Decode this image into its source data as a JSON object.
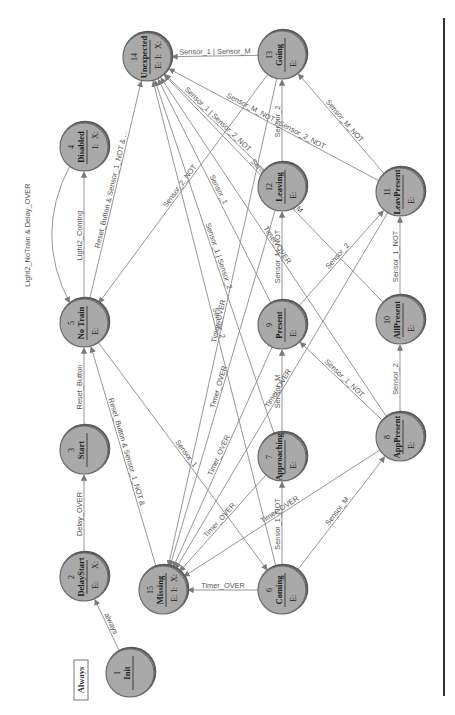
{
  "diagram": {
    "type": "state-machine",
    "orientation": "rotated-90-ccw",
    "colors": {
      "node_fill": "#a9a9a9",
      "node_stroke": "#6d6d6d",
      "edge": "#8a8a8a",
      "label": "#555555",
      "rule": "#333333"
    },
    "legend": {
      "label": "Always"
    },
    "nodes": [
      {
        "id": "1",
        "name": "Init",
        "x": 130,
        "y": 673,
        "marks": []
      },
      {
        "id": "2",
        "name": "DelayStart",
        "x": 84,
        "y": 577,
        "marks": [
          "E:",
          "X:"
        ]
      },
      {
        "id": "3",
        "name": "Start",
        "x": 84,
        "y": 450,
        "marks": []
      },
      {
        "id": "4",
        "name": "Disabled",
        "x": 84,
        "y": 147,
        "marks": [
          "I:",
          "X:"
        ]
      },
      {
        "id": "5",
        "name": "No Train",
        "x": 84,
        "y": 323,
        "marks": [
          "E:"
        ]
      },
      {
        "id": "6",
        "name": "Coming",
        "x": 282,
        "y": 590,
        "marks": [
          "E:"
        ]
      },
      {
        "id": "7",
        "name": "Approaching",
        "x": 282,
        "y": 457,
        "marks": [
          "E:"
        ]
      },
      {
        "id": "8",
        "name": "AppPresent",
        "x": 400,
        "y": 437,
        "marks": [
          "E:"
        ]
      },
      {
        "id": "9",
        "name": "Present",
        "x": 282,
        "y": 325,
        "marks": [
          "E:"
        ]
      },
      {
        "id": "10",
        "name": "AllPresent",
        "x": 400,
        "y": 320,
        "marks": [
          "E:"
        ]
      },
      {
        "id": "11",
        "name": "LeavPresent",
        "x": 400,
        "y": 192,
        "marks": [
          "E:"
        ]
      },
      {
        "id": "12",
        "name": "Leaving",
        "x": 282,
        "y": 187,
        "marks": [
          "E:"
        ]
      },
      {
        "id": "13",
        "name": "Going",
        "x": 282,
        "y": 55,
        "marks": [
          "E:"
        ]
      },
      {
        "id": "14",
        "name": "Unexpected",
        "x": 147,
        "y": 57,
        "marks": [
          "E:",
          "I:",
          "X:"
        ]
      },
      {
        "id": "15",
        "name": "Missing",
        "x": 163,
        "y": 590,
        "marks": [
          "E:",
          "I:",
          "X:"
        ]
      }
    ],
    "edges": [
      {
        "from": "1",
        "to": "2",
        "label": "always"
      },
      {
        "from": "2",
        "to": "3",
        "label": "Delay_OVER"
      },
      {
        "from": "3",
        "to": "5",
        "label": "Reset_Button"
      },
      {
        "from": "4",
        "to": "5",
        "label": "Light2_NoTrain & Delay_OVER",
        "curve": "left"
      },
      {
        "from": "5",
        "to": "4",
        "label": "Light2_Coming"
      },
      {
        "from": "5",
        "to": "14",
        "label": "Reset_Button & Sensor_1_NOT & ..."
      },
      {
        "from": "15",
        "to": "5",
        "label": "Reset_Button & Sensor_1_NOT & ..."
      },
      {
        "from": "5",
        "to": "6",
        "label": "Sensor_1"
      },
      {
        "from": "6",
        "to": "15",
        "label": "Timer_OVER"
      },
      {
        "from": "6",
        "to": "7",
        "label": "Sensor_1_NOT"
      },
      {
        "from": "6",
        "to": "8",
        "label": "Sensor_M"
      },
      {
        "from": "7",
        "to": "15",
        "label": "Timer_OVER"
      },
      {
        "from": "7",
        "to": "9",
        "label": "Sensor_M"
      },
      {
        "from": "8",
        "to": "15",
        "label": "Timer_OVER"
      },
      {
        "from": "8",
        "to": "9",
        "label": "Sensor_1_NOT"
      },
      {
        "from": "8",
        "to": "10",
        "label": "Sensor_2"
      },
      {
        "from": "9",
        "to": "15",
        "label": "Timer_OVER"
      },
      {
        "from": "9",
        "to": "12",
        "label": "Sensor_M_NOT"
      },
      {
        "from": "9",
        "to": "11",
        "label": "Sensor_2"
      },
      {
        "from": "10",
        "to": "11",
        "label": "Sensor_1_NOT"
      },
      {
        "from": "11",
        "to": "13",
        "label": "Sensor_M_NOT"
      },
      {
        "from": "11",
        "to": "14",
        "label": "Sensor_M_NOT | Sensor_2_NOT"
      },
      {
        "from": "12",
        "to": "13",
        "label": "Sensor_2"
      },
      {
        "from": "12",
        "to": "15",
        "label": "Timer_OVER"
      },
      {
        "from": "13",
        "to": "14",
        "label": "Sensor_1 | Sensor_M"
      },
      {
        "from": "13",
        "to": "15",
        "label": "Timer_OVER"
      },
      {
        "from": "13",
        "to": "5",
        "label": "Sensor_2_NOT"
      },
      {
        "from": "7",
        "to": "14",
        "label": "Sensor_1 | Sensor_2"
      },
      {
        "from": "9",
        "to": "14",
        "label": "Sensor_1"
      },
      {
        "from": "10",
        "to": "14",
        "label": "Sensor_1 | Sensor_M"
      },
      {
        "from": "12",
        "to": "14",
        "label": "Sensor_1 | Sensor_2_NOT"
      },
      {
        "from": "6",
        "to": "14",
        "label": "Sensor_2"
      },
      {
        "from": "8",
        "to": "14",
        "label": "Timer_OVER"
      },
      {
        "from": "11",
        "to": "15",
        "label": "Timer_OVER"
      }
    ]
  }
}
